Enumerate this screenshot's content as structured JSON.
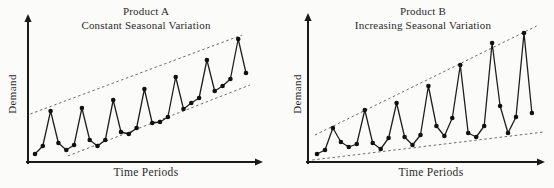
{
  "figure": {
    "background": "#fbfbfa",
    "ink_color": "#1a1a1a",
    "dashed_color": "#5a5a5a"
  },
  "chart_data": [
    {
      "type": "line",
      "title": "Product A",
      "subtitle": "Constant Seasonal Variation",
      "xlabel": "Time Periods",
      "ylabel": "Demand",
      "markers": "filled-circle",
      "grid": false,
      "legend": "none",
      "axis_tick_labels": false,
      "xlim": [
        0,
        30
      ],
      "ylim": [
        0,
        150
      ],
      "x": [
        1,
        2,
        3,
        4,
        5,
        6,
        7,
        8,
        9,
        10,
        11,
        12,
        13,
        14,
        15,
        16,
        17,
        18,
        19,
        20,
        21,
        22,
        23,
        24,
        25,
        26,
        27,
        28
      ],
      "values": [
        8,
        16,
        51,
        19,
        12,
        17,
        54,
        22,
        16,
        22,
        62,
        30,
        28,
        34,
        73,
        39,
        40,
        45,
        85,
        53,
        59,
        64,
        102,
        71,
        76,
        83,
        123,
        89
      ],
      "trend_envelope": {
        "style": "dashed",
        "upper": {
          "x": [
            0.4,
            27.5
          ],
          "y": [
            48,
            127
          ]
        },
        "lower": {
          "x": [
            5.2,
            28.5
          ],
          "y": [
            6,
            77
          ]
        }
      }
    },
    {
      "type": "line",
      "title": "Product B",
      "subtitle": "Increasing Seasonal Variation",
      "xlabel": "Time Periods",
      "ylabel": "Demand",
      "markers": "filled-circle",
      "grid": false,
      "legend": "none",
      "axis_tick_labels": false,
      "xlim": [
        0,
        30
      ],
      "ylim": [
        0,
        150
      ],
      "x": [
        1,
        2,
        3,
        4,
        5,
        6,
        7,
        8,
        9,
        10,
        11,
        12,
        13,
        14,
        15,
        16,
        17,
        18,
        19,
        20,
        21,
        22,
        23,
        24,
        25,
        26,
        27,
        28
      ],
      "values": [
        8,
        12,
        34,
        20,
        15,
        18,
        52,
        19,
        13,
        24,
        59,
        25,
        17,
        27,
        76,
        36,
        26,
        44,
        97,
        29,
        25,
        36,
        119,
        56,
        29,
        45,
        129,
        49
      ],
      "trend_envelope": {
        "style": "dashed",
        "upper": {
          "x": [
            0.75,
            28.6
          ],
          "y": [
            27,
            136
          ]
        },
        "lower": {
          "x": [
            0.4,
            29.5
          ],
          "y": [
            2,
            30
          ]
        }
      }
    }
  ]
}
